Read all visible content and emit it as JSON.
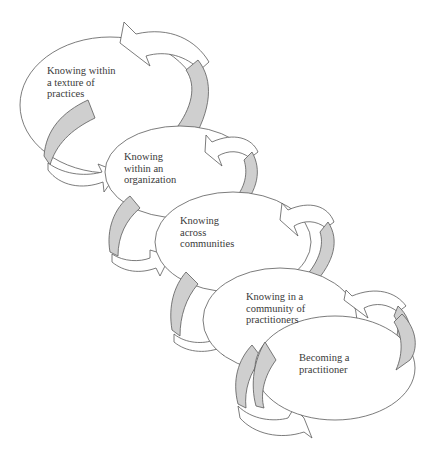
{
  "diagram": {
    "type": "cyclical-stage-diagram",
    "colors": {
      "outline": "#5a5a5a",
      "ribbon_shaded": "#cfcfcf",
      "fill": "#ffffff",
      "text": "#3a3a3a"
    },
    "stages": [
      {
        "id": "texture",
        "label": "Knowing within\na texture of\npractices"
      },
      {
        "id": "organization",
        "label": "Knowing\nwithin an\norganization"
      },
      {
        "id": "across",
        "label": "Knowing\nacross\ncommunities"
      },
      {
        "id": "community",
        "label": "Knowing in a\ncommunity of\npractitioners"
      },
      {
        "id": "becoming",
        "label": "Becoming a\npractitioner"
      }
    ],
    "connectors": "Each stage is encircled by a looping arrow ribbon (white with a shaded grey twist) that links it to the next stage, cascading diagonally from top-left to bottom-right."
  }
}
